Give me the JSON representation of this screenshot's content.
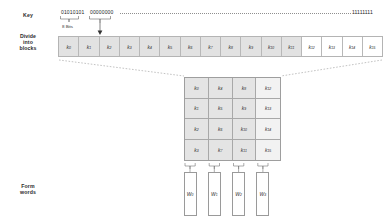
{
  "diagram": {
    "row_labels": {
      "key": "Key",
      "divide": "Divide\ninto\nblocks",
      "divide_line1": "Divide",
      "divide_line2": "into",
      "divide_line3": "blocks",
      "form_line1": "Form",
      "form_line2": "words"
    },
    "key_row": {
      "first_group": "01010101",
      "second_group": "00000000",
      "last_group": "11111111",
      "ellipsis_style": "dotted",
      "bit_width_label": "8 Bits"
    },
    "blocks": [
      {
        "label": "k",
        "index": "0",
        "shaded": true
      },
      {
        "label": "k",
        "index": "1",
        "shaded": true
      },
      {
        "label": "k",
        "index": "2",
        "shaded": true
      },
      {
        "label": "k",
        "index": "3",
        "shaded": true
      },
      {
        "label": "k",
        "index": "4",
        "shaded": true
      },
      {
        "label": "k",
        "index": "5",
        "shaded": true
      },
      {
        "label": "k",
        "index": "6",
        "shaded": true
      },
      {
        "label": "k",
        "index": "7",
        "shaded": true
      },
      {
        "label": "k",
        "index": "8",
        "shaded": true
      },
      {
        "label": "k",
        "index": "9",
        "shaded": true
      },
      {
        "label": "k",
        "index": "10",
        "shaded": true
      },
      {
        "label": "k",
        "index": "11",
        "shaded": true
      },
      {
        "label": "k",
        "index": "12",
        "shaded": false
      },
      {
        "label": "k",
        "index": "13",
        "shaded": false
      },
      {
        "label": "k",
        "index": "14",
        "shaded": false
      },
      {
        "label": "k",
        "index": "15",
        "shaded": false
      }
    ],
    "grid": {
      "rows": 4,
      "cols": 4,
      "order": "column-major",
      "cells": [
        [
          {
            "label": "k",
            "index": "0"
          },
          {
            "label": "k",
            "index": "4"
          },
          {
            "label": "k",
            "index": "8"
          },
          {
            "label": "k",
            "index": "12"
          }
        ],
        [
          {
            "label": "k",
            "index": "1"
          },
          {
            "label": "k",
            "index": "5"
          },
          {
            "label": "k",
            "index": "9"
          },
          {
            "label": "k",
            "index": "13"
          }
        ],
        [
          {
            "label": "k",
            "index": "2"
          },
          {
            "label": "k",
            "index": "6"
          },
          {
            "label": "k",
            "index": "10"
          },
          {
            "label": "k",
            "index": "14"
          }
        ],
        [
          {
            "label": "k",
            "index": "3"
          },
          {
            "label": "k",
            "index": "7"
          },
          {
            "label": "k",
            "index": "11"
          },
          {
            "label": "k",
            "index": "15"
          }
        ]
      ]
    },
    "words": [
      {
        "label": "W",
        "index": "0"
      },
      {
        "label": "W",
        "index": "1"
      },
      {
        "label": "W",
        "index": "2"
      },
      {
        "label": "W",
        "index": "3"
      }
    ],
    "colors": {
      "shaded_block": "#e2e2e2",
      "light_block": "#f2f2f2",
      "white": "#ffffff",
      "stroke": "#a8a8a8",
      "text": "#2a2a2a",
      "dotted": "#8f8f8f"
    }
  }
}
